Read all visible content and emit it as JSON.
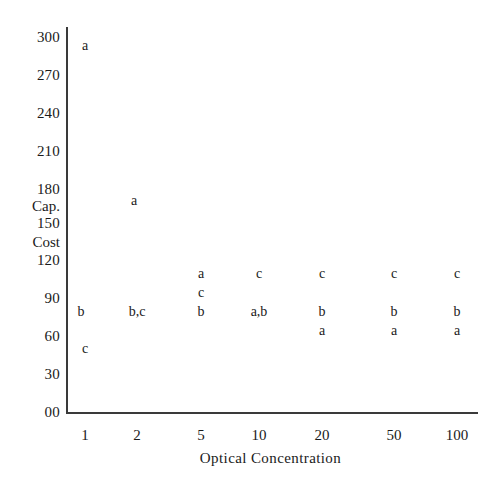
{
  "chart_data": {
    "type": "scatter",
    "title": "",
    "xlabel": "Optical  Concentration",
    "ylabel": "Cap. Cost",
    "ylabel_parts": [
      "Cap.",
      "Cost"
    ],
    "grid": false,
    "legend": "none",
    "xlim_categories": [
      "1",
      "2",
      "5",
      "10",
      "20",
      "50",
      "100"
    ],
    "x_tick_labels": [
      "1",
      "2",
      "5",
      "10",
      "20",
      "50",
      "100"
    ],
    "y_tick_labels": [
      "300",
      "270",
      "240",
      "210",
      "180",
      "150",
      "120",
      "90",
      "60",
      "30",
      "00"
    ],
    "ylim": [
      0,
      300
    ],
    "y_tick_values": [
      300,
      270,
      240,
      210,
      180,
      150,
      120,
      90,
      60,
      30,
      0
    ],
    "series": [
      {
        "name": "a",
        "points": [
          {
            "x": "1",
            "y": 290
          },
          {
            "x": "2",
            "y": 160
          },
          {
            "x": "5",
            "y": 105
          },
          {
            "x": "10",
            "y": 75
          },
          {
            "x": "20",
            "y": 63
          },
          {
            "x": "50",
            "y": 63
          },
          {
            "x": "100",
            "y": 63
          }
        ]
      },
      {
        "name": "b",
        "points": [
          {
            "x": "1",
            "y": 75
          },
          {
            "x": "2",
            "y": 75
          },
          {
            "x": "5",
            "y": 75
          },
          {
            "x": "10",
            "y": 75
          },
          {
            "x": "20",
            "y": 75
          },
          {
            "x": "50",
            "y": 75
          },
          {
            "x": "100",
            "y": 75
          }
        ]
      },
      {
        "name": "c",
        "points": [
          {
            "x": "1",
            "y": 45
          },
          {
            "x": "2",
            "y": 75
          },
          {
            "x": "5",
            "y": 100
          },
          {
            "x": "10",
            "y": 105
          },
          {
            "x": "20",
            "y": 105
          },
          {
            "x": "50",
            "y": 105
          },
          {
            "x": "100",
            "y": 105
          }
        ]
      }
    ],
    "marks": [
      {
        "label": "a",
        "col": "1",
        "row": "290"
      },
      {
        "label": "a",
        "col": "2",
        "row": "160"
      },
      {
        "label": "a",
        "col": "5",
        "row": "105"
      },
      {
        "label": "c",
        "col": "5",
        "row": "100"
      },
      {
        "label": "b",
        "col": "5",
        "row": "75"
      },
      {
        "label": "c",
        "col": "10",
        "row": "105"
      },
      {
        "label": "a,b",
        "col": "10",
        "row": "75"
      },
      {
        "label": "c",
        "col": "20",
        "row": "105"
      },
      {
        "label": "b",
        "col": "20",
        "row": "75"
      },
      {
        "label": "a",
        "col": "20",
        "row": "63"
      },
      {
        "label": "c",
        "col": "50",
        "row": "105"
      },
      {
        "label": "b",
        "col": "50",
        "row": "75"
      },
      {
        "label": "a",
        "col": "50",
        "row": "63"
      },
      {
        "label": "c",
        "col": "100",
        "row": "105"
      },
      {
        "label": "b",
        "col": "100",
        "row": "75"
      },
      {
        "label": "a",
        "col": "100",
        "row": "63"
      },
      {
        "label": "b",
        "col": "1",
        "row": "75"
      },
      {
        "label": "c",
        "col": "1",
        "row": "45"
      },
      {
        "label": "b,c",
        "col": "2",
        "row": "75"
      }
    ]
  },
  "axes": {
    "y_ticks": [
      {
        "label": "300",
        "top": 30
      },
      {
        "label": "270",
        "top": 68
      },
      {
        "label": "240",
        "top": 106
      },
      {
        "label": "210",
        "top": 144
      },
      {
        "label": "180",
        "top": 182
      },
      {
        "label": "150",
        "top": 216
      },
      {
        "label": "120",
        "top": 253
      },
      {
        "label": "90",
        "top": 291
      },
      {
        "label": "60",
        "top": 329
      },
      {
        "label": "30",
        "top": 367
      },
      {
        "label": "00",
        "top": 405
      }
    ],
    "y_words": [
      {
        "label": "Cap.",
        "top": 199
      },
      {
        "label": "Cost",
        "top": 235
      }
    ],
    "x_ticks": [
      {
        "label": "1",
        "left": 85
      },
      {
        "label": "2",
        "left": 137
      },
      {
        "label": "5",
        "left": 201
      },
      {
        "label": "10",
        "left": 259
      },
      {
        "label": "20",
        "left": 322
      },
      {
        "label": "50",
        "left": 394
      },
      {
        "label": "100",
        "left": 457
      }
    ],
    "x_title": "Optical  Concentration"
  },
  "marks": [
    {
      "label": "a",
      "left": 85,
      "top": 46
    },
    {
      "label": "a",
      "left": 134,
      "top": 201
    },
    {
      "label": "a",
      "left": 201,
      "top": 274
    },
    {
      "label": "c",
      "left": 201,
      "top": 293
    },
    {
      "label": "b",
      "left": 201,
      "top": 312
    },
    {
      "label": "c",
      "left": 259,
      "top": 274
    },
    {
      "label": "a,b",
      "left": 259,
      "top": 312
    },
    {
      "label": "c",
      "left": 322,
      "top": 274
    },
    {
      "label": "b",
      "left": 322,
      "top": 312
    },
    {
      "label": "a",
      "left": 322,
      "top": 331
    },
    {
      "label": "c",
      "left": 394,
      "top": 274
    },
    {
      "label": "b",
      "left": 394,
      "top": 312
    },
    {
      "label": "a",
      "left": 394,
      "top": 331
    },
    {
      "label": "c",
      "left": 457,
      "top": 274
    },
    {
      "label": "b",
      "left": 457,
      "top": 312
    },
    {
      "label": "a",
      "left": 457,
      "top": 331
    },
    {
      "label": "b",
      "left": 81,
      "top": 312
    },
    {
      "label": "c",
      "left": 85,
      "top": 349
    },
    {
      "label": "b,c",
      "left": 137,
      "top": 312
    }
  ],
  "colors": {
    "axis": "#3a3a3a",
    "text": "#1a1a1a",
    "background": "#ffffff"
  }
}
